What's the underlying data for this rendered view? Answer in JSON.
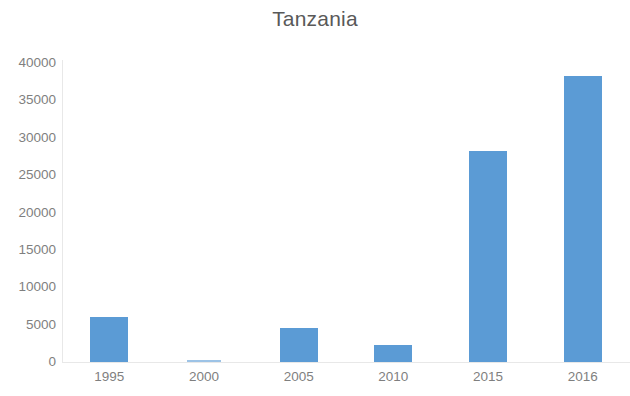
{
  "chart_data": {
    "type": "bar",
    "title": "Tanzania",
    "xlabel": "",
    "ylabel": "",
    "categories": [
      "1995",
      "2000",
      "2005",
      "2010",
      "2015",
      "2016"
    ],
    "values": [
      6000,
      250,
      4500,
      2300,
      28200,
      38200
    ],
    "series": [
      {
        "name": "Tanzania",
        "values": [
          6000,
          250,
          4500,
          2300,
          28200,
          38200
        ]
      }
    ],
    "ylim": [
      0,
      40000
    ],
    "ytick_labels": [
      "40000",
      "35000",
      "30000",
      "25000",
      "20000",
      "15000",
      "10000",
      "5000",
      "0"
    ],
    "ytick_values": [
      40000,
      35000,
      30000,
      25000,
      20000,
      15000,
      10000,
      5000,
      0
    ],
    "grid": false,
    "legend": false,
    "legend_position": "none",
    "bar_color": "#5b9bd5",
    "axis_text_color": "#7f7f7f",
    "title_color": "#595959",
    "background_color": "#ffffff"
  }
}
